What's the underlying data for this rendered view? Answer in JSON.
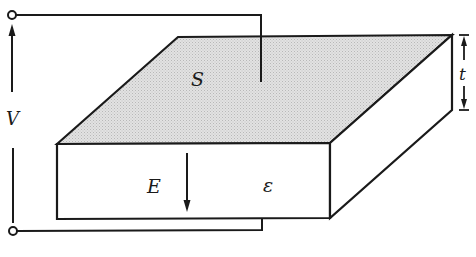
{
  "diagram": {
    "labels": {
      "area": "S",
      "voltage": "V",
      "field": "E",
      "permittivity": "ε",
      "thickness": "t"
    },
    "colors": {
      "line": "#1a1a1a",
      "top_face_fill": "#d4d4d4",
      "background": "#ffffff"
    }
  }
}
